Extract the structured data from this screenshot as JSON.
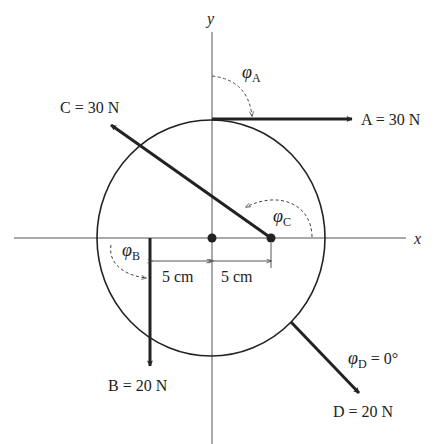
{
  "axes": {
    "x_label": "x",
    "y_label": "y"
  },
  "forces": {
    "A": {
      "label": "A = 30 N",
      "magnitude": "30 N"
    },
    "B": {
      "label": "B = 20 N",
      "magnitude": "20 N"
    },
    "C": {
      "label": "C = 30 N",
      "magnitude": "30 N"
    },
    "D": {
      "label": "D = 20 N",
      "magnitude": "20 N"
    }
  },
  "angles": {
    "phi": "φ",
    "A_sub": "A",
    "B_sub": "B",
    "C_sub": "C",
    "D_sub": "D",
    "D_value": " = 0°"
  },
  "dimensions": {
    "left": "5 cm",
    "right": "5 cm"
  },
  "colors": {
    "ink": "#222222",
    "thin": "#444444"
  }
}
